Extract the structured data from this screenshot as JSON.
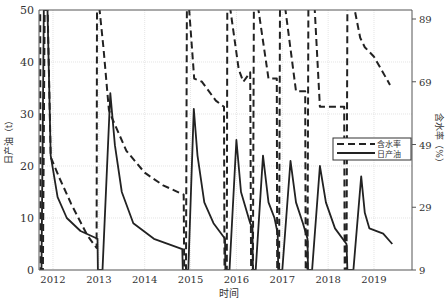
{
  "chart_data": {
    "type": "line",
    "title": "",
    "xlabel": "时间",
    "ylabel_left": "日产油（t）",
    "ylabel_right": "含水率（%）",
    "xlim": [
      2011.7,
      2019.85
    ],
    "ylim_left": [
      0,
      50
    ],
    "ylim_right": [
      9,
      94
    ],
    "x_ticks": [
      "2012",
      "2013",
      "2014",
      "2015",
      "2016",
      "2017",
      "2018",
      "2019"
    ],
    "y_ticks_left": [
      0,
      10,
      20,
      30,
      40,
      50
    ],
    "y_ticks_right": [
      9,
      29,
      49,
      69,
      89
    ],
    "grid": true,
    "legend": {
      "position": "right-center",
      "entries": [
        "含水率",
        "日产油"
      ]
    },
    "series": [
      {
        "name": "日产油",
        "axis": "left",
        "style": "solid",
        "points": [
          [
            2011.75,
            0
          ],
          [
            2011.8,
            50
          ],
          [
            2011.88,
            50
          ],
          [
            2011.95,
            22
          ],
          [
            2012.1,
            14
          ],
          [
            2012.3,
            10
          ],
          [
            2012.6,
            7.5
          ],
          [
            2012.97,
            6
          ],
          [
            2012.98,
            0
          ],
          [
            2013.08,
            0
          ],
          [
            2013.25,
            34
          ],
          [
            2013.35,
            24
          ],
          [
            2013.5,
            15
          ],
          [
            2013.75,
            9
          ],
          [
            2014.2,
            6
          ],
          [
            2014.82,
            4
          ],
          [
            2014.83,
            0
          ],
          [
            2014.95,
            0
          ],
          [
            2015.07,
            31
          ],
          [
            2015.15,
            22
          ],
          [
            2015.3,
            13
          ],
          [
            2015.5,
            9
          ],
          [
            2015.75,
            6
          ],
          [
            2015.76,
            0
          ],
          [
            2015.85,
            0
          ],
          [
            2016.0,
            25
          ],
          [
            2016.1,
            15
          ],
          [
            2016.3,
            9
          ],
          [
            2016.35,
            8
          ],
          [
            2016.36,
            0
          ],
          [
            2016.42,
            0
          ],
          [
            2016.58,
            22
          ],
          [
            2016.7,
            13
          ],
          [
            2016.83,
            10
          ],
          [
            2016.9,
            7
          ],
          [
            2016.91,
            0
          ],
          [
            2017.0,
            0
          ],
          [
            2017.18,
            21
          ],
          [
            2017.3,
            13
          ],
          [
            2017.45,
            9
          ],
          [
            2017.55,
            6
          ],
          [
            2017.56,
            0
          ],
          [
            2017.65,
            0
          ],
          [
            2017.82,
            20
          ],
          [
            2017.95,
            13
          ],
          [
            2018.15,
            8
          ],
          [
            2018.4,
            5
          ],
          [
            2018.42,
            0
          ],
          [
            2018.55,
            0
          ],
          [
            2018.72,
            18
          ],
          [
            2018.8,
            11
          ],
          [
            2018.9,
            8
          ],
          [
            2019.2,
            7
          ],
          [
            2019.4,
            5
          ]
        ]
      },
      {
        "name": "含水率",
        "axis": "right",
        "style": "dashed",
        "points": [
          [
            2011.72,
            94
          ],
          [
            2011.73,
            9
          ],
          [
            2011.78,
            9
          ],
          [
            2011.82,
            94
          ],
          [
            2011.88,
            94
          ],
          [
            2011.95,
            45
          ],
          [
            2012.15,
            38
          ],
          [
            2012.4,
            30
          ],
          [
            2012.75,
            20
          ],
          [
            2012.95,
            16
          ],
          [
            2012.96,
            94
          ],
          [
            2013.0,
            94
          ],
          [
            2013.1,
            80
          ],
          [
            2013.22,
            60
          ],
          [
            2013.3,
            57
          ],
          [
            2013.6,
            47
          ],
          [
            2014.0,
            40
          ],
          [
            2014.4,
            36
          ],
          [
            2014.85,
            33
          ],
          [
            2014.86,
            9
          ],
          [
            2014.9,
            9
          ],
          [
            2014.92,
            94
          ],
          [
            2014.96,
            94
          ],
          [
            2015.08,
            70
          ],
          [
            2015.25,
            69
          ],
          [
            2015.55,
            63
          ],
          [
            2015.73,
            61
          ],
          [
            2015.74,
            9
          ],
          [
            2015.79,
            9
          ],
          [
            2015.8,
            94
          ],
          [
            2015.85,
            94
          ],
          [
            2016.05,
            73
          ],
          [
            2016.15,
            69
          ],
          [
            2016.3,
            72
          ],
          [
            2016.32,
            9
          ],
          [
            2016.36,
            9
          ],
          [
            2016.38,
            94
          ],
          [
            2016.46,
            94
          ],
          [
            2016.7,
            70
          ],
          [
            2016.88,
            70
          ],
          [
            2016.89,
            9
          ],
          [
            2016.93,
            9
          ],
          [
            2016.95,
            94
          ],
          [
            2017.05,
            94
          ],
          [
            2017.3,
            66
          ],
          [
            2017.5,
            66
          ],
          [
            2017.51,
            9
          ],
          [
            2017.55,
            9
          ],
          [
            2017.57,
            94
          ],
          [
            2017.7,
            94
          ],
          [
            2017.82,
            61
          ],
          [
            2018.15,
            61
          ],
          [
            2018.35,
            61
          ],
          [
            2018.36,
            9
          ],
          [
            2018.4,
            9
          ],
          [
            2018.42,
            94
          ],
          [
            2018.55,
            94
          ],
          [
            2018.7,
            83
          ],
          [
            2018.8,
            80
          ],
          [
            2019.0,
            77
          ],
          [
            2019.35,
            68
          ]
        ]
      }
    ]
  }
}
